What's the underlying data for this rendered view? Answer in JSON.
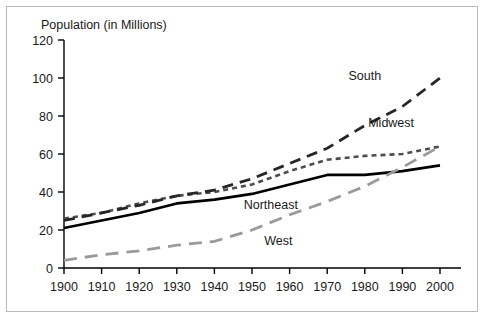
{
  "chart_data": {
    "type": "line",
    "title": "Population (in Millions)",
    "xlabel": "",
    "ylabel": "Population (in Millions)",
    "x": [
      1900,
      1910,
      1920,
      1930,
      1940,
      1950,
      1960,
      1970,
      1980,
      1990,
      2000
    ],
    "xlim": [
      1900,
      2000
    ],
    "ylim": [
      0,
      120
    ],
    "xticks": [
      1900,
      1910,
      1920,
      1930,
      1940,
      1950,
      1960,
      1970,
      1980,
      1990,
      2000
    ],
    "yticks": [
      0,
      20,
      40,
      60,
      80,
      100,
      120
    ],
    "xtick_labels": [
      "1900",
      "1910",
      "1920",
      "1930",
      "1940",
      "1950",
      "1960",
      "1970",
      "1980",
      "1990",
      "2000"
    ],
    "ytick_labels": [
      "0",
      "20",
      "40",
      "60",
      "80",
      "100",
      "120"
    ],
    "grid": false,
    "legend_position": "inline-labels",
    "series": [
      {
        "name": "Northeast",
        "style": "solid",
        "color": "#000000",
        "label_x": 1955,
        "label_y": 31,
        "values": [
          21,
          25,
          29,
          34,
          36,
          39,
          44,
          49,
          49,
          51,
          54
        ]
      },
      {
        "name": "Midwest",
        "style": "dotted",
        "color": "#4d4d4d",
        "label_x": 1987,
        "label_y": 74,
        "values": [
          26,
          29,
          34,
          38,
          40,
          44,
          51,
          57,
          59,
          60,
          64
        ]
      },
      {
        "name": "South",
        "style": "dashed",
        "color": "#262626",
        "label_x": 1980,
        "label_y": 99,
        "values": [
          25,
          29,
          33,
          38,
          41,
          47,
          55,
          63,
          75,
          85,
          100
        ]
      },
      {
        "name": "West",
        "style": "long-dashed",
        "color": "#9a9a9a",
        "label_x": 1957,
        "label_y": 12,
        "values": [
          4,
          7,
          9,
          12,
          14,
          20,
          28,
          35,
          43,
          53,
          64
        ]
      }
    ]
  },
  "figure": {
    "background_color": "#ffffff",
    "border_color": "#b9b9b9",
    "axis_color": "#000000"
  }
}
